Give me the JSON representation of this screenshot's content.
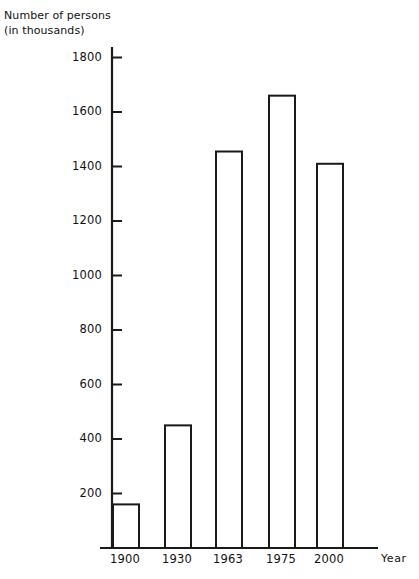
{
  "chart_data": {
    "type": "bar",
    "title": "",
    "ylabel": "Number of persons\n(in thousands)",
    "ylabel_line1": "Number of persons",
    "ylabel_line2": "(in thousands)",
    "xlabel": "Year",
    "categories": [
      "1900",
      "1930",
      "1963",
      "1975",
      "2000"
    ],
    "values": [
      160,
      450,
      1455,
      1660,
      1410
    ],
    "ylim": [
      0,
      1900
    ],
    "ytick_labels": [
      "200",
      "400",
      "600",
      "800",
      "1000",
      "1200",
      "1400",
      "1600",
      "1800"
    ],
    "yticks": [
      200,
      400,
      600,
      800,
      1000,
      1200,
      1400,
      1600,
      1800
    ],
    "grid": false,
    "legend": null,
    "bar_fill_color": "#ffffff",
    "bar_edge_color": "#1a1a1a",
    "axis_color": "#1a1a1a",
    "background_color": "#ffffff"
  }
}
